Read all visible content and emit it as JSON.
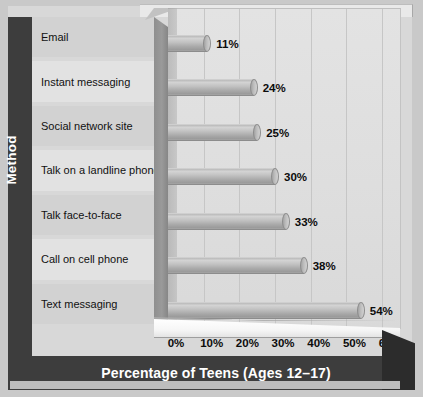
{
  "chart_data": {
    "type": "bar",
    "orientation": "horizontal",
    "title": "",
    "xlabel": "Percentage of Teens (Ages 12–17)",
    "ylabel": "Method",
    "categories": [
      "Email",
      "Instant messaging",
      "Social network site",
      "Talk on a landline phone",
      "Talk face-to-face",
      "Call on cell phone",
      "Text messaging"
    ],
    "values": [
      11,
      24,
      25,
      30,
      33,
      38,
      54
    ],
    "value_labels": [
      "11%",
      "24%",
      "25%",
      "30%",
      "33%",
      "38%",
      "54%"
    ],
    "xlim": [
      0,
      65
    ],
    "xticks": [
      0,
      10,
      20,
      30,
      40,
      50,
      60
    ],
    "xtick_labels": [
      "0%",
      "10%",
      "20%",
      "30%",
      "40%",
      "50%",
      "60%"
    ],
    "grid": "vertical",
    "legend": "none",
    "style": "3d-cylinder-bar",
    "colors": {
      "bar": "#b5b5b5",
      "plot_background": "#dedede",
      "label_panel_light": "#e2e2e2",
      "label_panel_dark": "#d2d2d2",
      "axis_band": "#3d3d3d",
      "axis_band_text": "#ffffff",
      "gridline": "#c6c6c6",
      "page_background": "#c9c9c9"
    }
  }
}
